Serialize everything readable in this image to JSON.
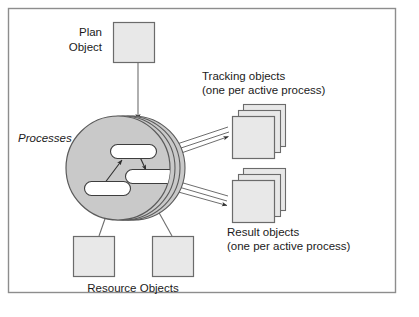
{
  "figure": {
    "frame": {
      "border_color": "#8d8d8d",
      "background_color": "#ffffff"
    },
    "palette": {
      "box_fill": "#e8e8e8",
      "box_stroke": "#6b6b6b",
      "disk_fill": "#c9c9c9",
      "disk_stroke": "#5a5a5a",
      "pill_fill": "#ffffff",
      "pill_stroke": "#3d3d3d",
      "connector_color": "#6e6e6e",
      "arrow_color": "#2e2e2e",
      "text_color": "#1b1b1b"
    },
    "labels": {
      "plan_object_line1": "Plan",
      "plan_object_line2": "Object",
      "processes": "Processes",
      "tracking_line1": "Tracking objects",
      "tracking_line2": "(one per active process)",
      "result_line1": "Result objects",
      "result_line2": "(one per active process)",
      "resource_objects": "Resource Objects"
    },
    "nodes": {
      "plan_object": {
        "name": "Plan Object",
        "shape": "square",
        "count": 1
      },
      "processes_disk": {
        "name": "Processes",
        "shape": "stacked-disk",
        "layer_count": 4,
        "inner_pill_count": 3
      },
      "tracking_objects": {
        "name": "Tracking objects",
        "shape": "stacked-square",
        "stack_count": 3
      },
      "result_objects": {
        "name": "Result objects",
        "shape": "stacked-square",
        "stack_count": 3
      },
      "resource_objects": {
        "name": "Resource Objects",
        "shape": "square",
        "count": 2
      }
    },
    "connections": [
      {
        "from": "plan_object",
        "to": "processes_disk",
        "style": "single-line",
        "arrow": true
      },
      {
        "from": "processes_disk",
        "to": "tracking_objects",
        "style": "double-line",
        "arrow": true
      },
      {
        "from": "processes_disk",
        "to": "result_objects",
        "style": "double-line",
        "arrow": true
      },
      {
        "from": "resource_object_left",
        "to": "processes_disk",
        "style": "single-line",
        "arrow": true
      },
      {
        "from": "resource_object_right",
        "to": "processes_disk",
        "style": "single-line",
        "arrow": true
      },
      {
        "from": "pill_bottom_left",
        "to": "pill_top",
        "style": "single-line",
        "arrow": true
      },
      {
        "from": "pill_top",
        "to": "pill_middle_right",
        "style": "single-line",
        "arrow": true
      }
    ]
  }
}
